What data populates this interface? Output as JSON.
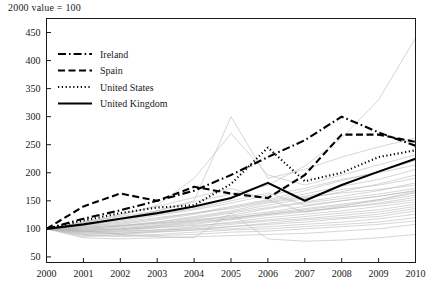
{
  "chart_data": {
    "type": "line",
    "title": "2000 value = 100",
    "xlabel": "",
    "ylabel": "",
    "x": [
      2000,
      2001,
      2002,
      2003,
      2004,
      2005,
      2006,
      2007,
      2008,
      2009,
      2010
    ],
    "xtick_labels": [
      "2000",
      "2001",
      "2002",
      "2003",
      "2004",
      "2005",
      "2006",
      "2007",
      "2008",
      "2009",
      "2010"
    ],
    "ytick_labels": [
      "50",
      "100",
      "150",
      "200",
      "250",
      "300",
      "350",
      "400",
      "450"
    ],
    "ytick_values": [
      50,
      100,
      150,
      200,
      250,
      300,
      350,
      400,
      450
    ],
    "xlim": [
      2000,
      2010
    ],
    "ylim": [
      40,
      475
    ],
    "grid": false,
    "legend_position": "top-left",
    "series": [
      {
        "name": "Ireland",
        "style": "dash-dot",
        "color": "#000000",
        "highlight": true,
        "values": [
          100,
          118,
          133,
          150,
          168,
          196,
          228,
          258,
          300,
          272,
          248
        ]
      },
      {
        "name": "Spain",
        "style": "dashed",
        "color": "#000000",
        "highlight": true,
        "values": [
          100,
          140,
          163,
          150,
          175,
          163,
          155,
          196,
          268,
          268,
          255
        ]
      },
      {
        "name": "United States",
        "style": "dotted",
        "color": "#000000",
        "highlight": true,
        "values": [
          100,
          115,
          128,
          138,
          142,
          180,
          245,
          185,
          200,
          228,
          240
        ]
      },
      {
        "name": "United Kingdom",
        "style": "solid",
        "color": "#000000",
        "highlight": true,
        "values": [
          100,
          108,
          118,
          128,
          140,
          155,
          182,
          150,
          178,
          202,
          225
        ]
      },
      {
        "name": "other-1",
        "style": "solid",
        "color": "#b4b4b4",
        "highlight": false,
        "values": [
          100,
          112,
          122,
          132,
          148,
          162,
          178,
          212,
          262,
          330,
          440
        ]
      },
      {
        "name": "other-2",
        "style": "solid",
        "color": "#b4b4b4",
        "highlight": false,
        "values": [
          100,
          108,
          118,
          132,
          150,
          300,
          190,
          206,
          228,
          246,
          262
        ]
      },
      {
        "name": "other-3",
        "style": "solid",
        "color": "#b4b4b4",
        "highlight": false,
        "values": [
          100,
          110,
          124,
          142,
          190,
          270,
          196,
          178,
          196,
          214,
          232
        ]
      },
      {
        "name": "other-4",
        "style": "solid",
        "color": "#b4b4b4",
        "highlight": false,
        "values": [
          100,
          104,
          112,
          120,
          128,
          140,
          152,
          168,
          186,
          202,
          222
        ]
      },
      {
        "name": "other-5",
        "style": "solid",
        "color": "#b4b4b4",
        "highlight": false,
        "values": [
          100,
          106,
          114,
          124,
          134,
          146,
          160,
          172,
          188,
          200,
          214
        ]
      },
      {
        "name": "other-6",
        "style": "solid",
        "color": "#b4b4b4",
        "highlight": false,
        "values": [
          100,
          102,
          108,
          116,
          126,
          138,
          150,
          162,
          176,
          188,
          206
        ]
      },
      {
        "name": "other-7",
        "style": "solid",
        "color": "#b4b4b4",
        "highlight": false,
        "values": [
          100,
          100,
          106,
          112,
          120,
          130,
          142,
          154,
          166,
          180,
          196
        ]
      },
      {
        "name": "other-8",
        "style": "solid",
        "color": "#b4b4b4",
        "highlight": false,
        "values": [
          100,
          104,
          110,
          118,
          128,
          136,
          148,
          158,
          170,
          178,
          190
        ]
      },
      {
        "name": "other-9",
        "style": "solid",
        "color": "#b4b4b4",
        "highlight": false,
        "values": [
          100,
          98,
          104,
          110,
          118,
          128,
          138,
          148,
          158,
          168,
          182
        ]
      },
      {
        "name": "other-10",
        "style": "solid",
        "color": "#b4b4b4",
        "highlight": false,
        "values": [
          100,
          101,
          105,
          112,
          122,
          132,
          146,
          156,
          164,
          170,
          178
        ]
      },
      {
        "name": "other-11",
        "style": "solid",
        "color": "#b4b4b4",
        "highlight": false,
        "values": [
          100,
          96,
          100,
          106,
          114,
          124,
          136,
          146,
          154,
          162,
          172
        ]
      },
      {
        "name": "other-12",
        "style": "solid",
        "color": "#b4b4b4",
        "highlight": false,
        "values": [
          100,
          99,
          102,
          108,
          116,
          122,
          130,
          140,
          150,
          158,
          168
        ]
      },
      {
        "name": "other-13",
        "style": "solid",
        "color": "#b4b4b4",
        "highlight": false,
        "values": [
          100,
          95,
          98,
          104,
          110,
          118,
          128,
          136,
          144,
          152,
          164
        ]
      },
      {
        "name": "other-14",
        "style": "solid",
        "color": "#b4b4b4",
        "highlight": false,
        "values": [
          100,
          102,
          106,
          110,
          114,
          120,
          126,
          134,
          142,
          150,
          160
        ]
      },
      {
        "name": "other-15",
        "style": "solid",
        "color": "#b4b4b4",
        "highlight": false,
        "values": [
          100,
          94,
          96,
          102,
          108,
          116,
          124,
          130,
          138,
          146,
          156
        ]
      },
      {
        "name": "other-16",
        "style": "solid",
        "color": "#b4b4b4",
        "highlight": false,
        "values": [
          100,
          97,
          100,
          105,
          112,
          118,
          126,
          132,
          138,
          144,
          152
        ]
      },
      {
        "name": "other-17",
        "style": "solid",
        "color": "#b4b4b4",
        "highlight": false,
        "values": [
          100,
          92,
          94,
          98,
          104,
          112,
          120,
          126,
          132,
          140,
          148
        ]
      },
      {
        "name": "other-18",
        "style": "solid",
        "color": "#b4b4b4",
        "highlight": false,
        "values": [
          100,
          98,
          99,
          102,
          106,
          110,
          116,
          122,
          128,
          134,
          144
        ]
      },
      {
        "name": "other-19",
        "style": "solid",
        "color": "#b4b4b4",
        "highlight": false,
        "values": [
          100,
          90,
          92,
          96,
          102,
          108,
          114,
          118,
          124,
          130,
          140
        ]
      },
      {
        "name": "other-20",
        "style": "solid",
        "color": "#b4b4b4",
        "highlight": false,
        "values": [
          100,
          95,
          96,
          98,
          100,
          104,
          110,
          116,
          120,
          126,
          136
        ]
      },
      {
        "name": "other-21",
        "style": "solid",
        "color": "#b4b4b4",
        "highlight": false,
        "values": [
          100,
          88,
          90,
          94,
          98,
          104,
          108,
          112,
          118,
          122,
          132
        ]
      },
      {
        "name": "other-22",
        "style": "solid",
        "color": "#b4b4b4",
        "highlight": false,
        "values": [
          100,
          93,
          92,
          95,
          98,
          100,
          104,
          108,
          112,
          118,
          126
        ]
      },
      {
        "name": "other-23",
        "style": "solid",
        "color": "#b4b4b4",
        "highlight": false,
        "values": [
          100,
          86,
          88,
          90,
          94,
          98,
          100,
          104,
          108,
          112,
          120
        ]
      },
      {
        "name": "other-24",
        "style": "solid",
        "color": "#b4b4b4",
        "highlight": false,
        "values": [
          100,
          90,
          86,
          88,
          90,
          94,
          96,
          100,
          104,
          108,
          114
        ]
      },
      {
        "name": "other-25",
        "style": "solid",
        "color": "#b4b4b4",
        "highlight": false,
        "values": [
          100,
          84,
          82,
          84,
          86,
          88,
          90,
          92,
          96,
          100,
          108
        ]
      },
      {
        "name": "other-26",
        "style": "solid",
        "color": "#b4b4b4",
        "highlight": false,
        "values": [
          100,
          96,
          90,
          86,
          84,
          128,
          82,
          78,
          80,
          84,
          90
        ]
      },
      {
        "name": "other-27",
        "style": "solid",
        "color": "#b4b4b4",
        "highlight": false,
        "values": [
          100,
          106,
          116,
          126,
          136,
          150,
          164,
          142,
          150,
          158,
          168
        ]
      },
      {
        "name": "other-28",
        "style": "solid",
        "color": "#b4b4b4",
        "highlight": false,
        "values": [
          100,
          112,
          126,
          140,
          156,
          172,
          152,
          130,
          140,
          152,
          166
        ]
      }
    ]
  }
}
